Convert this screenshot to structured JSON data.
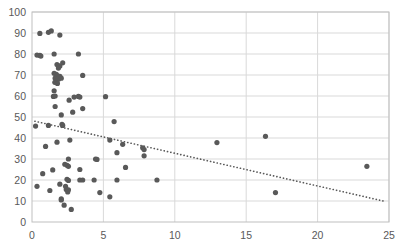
{
  "chart_data": {
    "type": "scatter",
    "title": "",
    "subtitle": "",
    "xlabel": "",
    "ylabel": "",
    "xlim": [
      0,
      25
    ],
    "ylim": [
      0,
      100
    ],
    "xticks": [
      0,
      5,
      10,
      15,
      20,
      25
    ],
    "yticks": [
      0,
      10,
      20,
      30,
      40,
      50,
      60,
      70,
      80,
      90,
      100
    ],
    "xtick_labels": [
      "0",
      "5",
      "10",
      "15",
      "20",
      "25"
    ],
    "ytick_labels": [
      "0",
      "10",
      "20",
      "30",
      "40",
      "50",
      "60",
      "70",
      "80",
      "90",
      "100"
    ],
    "grid": "horizontal-and-vertical",
    "grid_color": "#d9d9d9",
    "legend": "none",
    "marker": {
      "shape": "circle",
      "color": "#595959",
      "size_px": 5.2
    },
    "series": [
      {
        "name": "Series 1",
        "points": [
          [
            0.55,
            89.8
          ],
          [
            1.15,
            90.3
          ],
          [
            1.35,
            91.0
          ],
          [
            1.95,
            89.0
          ],
          [
            0.35,
            79.5
          ],
          [
            0.55,
            79.3
          ],
          [
            0.62,
            79.0
          ],
          [
            1.55,
            80.0
          ],
          [
            3.25,
            80.0
          ],
          [
            1.75,
            75.0
          ],
          [
            1.95,
            74.3
          ],
          [
            2.15,
            75.8
          ],
          [
            1.85,
            73.3
          ],
          [
            1.55,
            70.8
          ],
          [
            1.7,
            70.3
          ],
          [
            1.8,
            69.6
          ],
          [
            1.95,
            69.3
          ],
          [
            1.62,
            68.5
          ],
          [
            1.85,
            68.0
          ],
          [
            2.05,
            68.5
          ],
          [
            3.55,
            69.8
          ],
          [
            1.6,
            66.5
          ],
          [
            1.78,
            66.0
          ],
          [
            1.55,
            62.5
          ],
          [
            1.5,
            59.8
          ],
          [
            1.62,
            60.0
          ],
          [
            2.95,
            59.5
          ],
          [
            3.25,
            59.8
          ],
          [
            3.35,
            59.5
          ],
          [
            5.15,
            59.7
          ],
          [
            1.62,
            55.0
          ],
          [
            2.6,
            58.0
          ],
          [
            3.55,
            54.0
          ],
          [
            2.85,
            52.3
          ],
          [
            2.05,
            51.0
          ],
          [
            2.1,
            46.5
          ],
          [
            2.15,
            46.0
          ],
          [
            0.25,
            45.7
          ],
          [
            1.15,
            46.0
          ],
          [
            5.75,
            47.8
          ],
          [
            2.65,
            39.0
          ],
          [
            1.75,
            38.0
          ],
          [
            5.45,
            39.0
          ],
          [
            6.35,
            37.0
          ],
          [
            12.95,
            37.8
          ],
          [
            16.35,
            40.8
          ],
          [
            7.75,
            35.3
          ],
          [
            7.85,
            34.5
          ],
          [
            0.95,
            36.0
          ],
          [
            7.85,
            31.5
          ],
          [
            4.45,
            30.0
          ],
          [
            4.55,
            29.8
          ],
          [
            2.55,
            30.0
          ],
          [
            5.95,
            33.0
          ],
          [
            2.45,
            27.0
          ],
          [
            2.55,
            26.5
          ],
          [
            2.3,
            27.5
          ],
          [
            6.55,
            26.0
          ],
          [
            23.45,
            26.5
          ],
          [
            3.35,
            25.0
          ],
          [
            1.45,
            24.8
          ],
          [
            0.75,
            23.0
          ],
          [
            2.45,
            20.3
          ],
          [
            2.55,
            19.8
          ],
          [
            3.35,
            20.0
          ],
          [
            3.55,
            20.0
          ],
          [
            4.35,
            20.0
          ],
          [
            5.95,
            20.0
          ],
          [
            8.75,
            20.0
          ],
          [
            2.35,
            17.0
          ],
          [
            1.95,
            18.0
          ],
          [
            0.35,
            17.0
          ],
          [
            2.4,
            15.5
          ],
          [
            2.55,
            15.3
          ],
          [
            2.5,
            14.3
          ],
          [
            1.25,
            15.0
          ],
          [
            4.75,
            14.0
          ],
          [
            17.05,
            14.0
          ],
          [
            5.45,
            12.0
          ],
          [
            2.05,
            11.0
          ],
          [
            2.05,
            10.5
          ],
          [
            2.25,
            8.0
          ],
          [
            2.75,
            6.0
          ]
        ]
      }
    ],
    "trendline": {
      "type": "linear-dotted",
      "color": "#595959",
      "style": "dotted",
      "from": [
        0.2,
        48.0
      ],
      "to": [
        24.6,
        10.0
      ]
    }
  },
  "axes": {
    "x_axis_name": "x-axis",
    "y_axis_name": "y-axis",
    "plot_area_name": "plot-area"
  }
}
